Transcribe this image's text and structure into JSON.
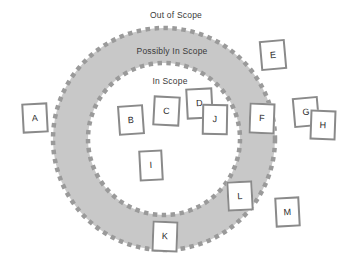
{
  "diagram": {
    "type": "scope-venn-ring",
    "canvas": {
      "width": 351,
      "height": 265,
      "background": "#ffffff"
    },
    "colors": {
      "band_fill": "#c8c8c8",
      "boundary_dash": "#9a9a9a",
      "box_border": "#8a8a8a",
      "box_fill": "#ffffff",
      "label_text": "#3a3a3a",
      "item_text": "#2b2b2b"
    },
    "rings": {
      "center": {
        "x": 164,
        "y": 139
      },
      "outer_radius": 111,
      "inner_radius": 76
    },
    "zones": [
      {
        "id": "out-of-scope",
        "label": "Out of Scope",
        "x": 176,
        "y": 10
      },
      {
        "id": "possibly-in-scope",
        "label": "Possibly In Scope",
        "x": 172,
        "y": 46
      },
      {
        "id": "in-scope",
        "label": "In Scope",
        "x": 170,
        "y": 76
      }
    ],
    "items": [
      {
        "id": "A",
        "label": "A",
        "zone": "out-of-scope",
        "x": 22,
        "y": 103,
        "w": 26,
        "h": 30,
        "rotate": -3
      },
      {
        "id": "B",
        "label": "B",
        "zone": "in-scope",
        "x": 118,
        "y": 105,
        "w": 26,
        "h": 30,
        "rotate": -4
      },
      {
        "id": "C",
        "label": "C",
        "zone": "in-scope",
        "x": 153,
        "y": 96,
        "w": 27,
        "h": 30,
        "rotate": 3
      },
      {
        "id": "D",
        "label": "D",
        "zone": "in-scope",
        "x": 186,
        "y": 88,
        "w": 27,
        "h": 31,
        "rotate": -3
      },
      {
        "id": "J",
        "label": "J",
        "zone": "in-scope",
        "x": 202,
        "y": 104,
        "w": 26,
        "h": 31,
        "rotate": 1
      },
      {
        "id": "E",
        "label": "E",
        "zone": "out-of-scope",
        "x": 260,
        "y": 40,
        "w": 26,
        "h": 30,
        "rotate": -5
      },
      {
        "id": "F",
        "label": "F",
        "zone": "possibly-in-scope",
        "x": 249,
        "y": 103,
        "w": 26,
        "h": 31,
        "rotate": 2
      },
      {
        "id": "G",
        "label": "G",
        "zone": "out-of-scope",
        "x": 293,
        "y": 97,
        "w": 26,
        "h": 30,
        "rotate": -5
      },
      {
        "id": "H",
        "label": "H",
        "zone": "out-of-scope",
        "x": 310,
        "y": 110,
        "w": 26,
        "h": 30,
        "rotate": 2
      },
      {
        "id": "I",
        "label": "I",
        "zone": "in-scope",
        "x": 139,
        "y": 150,
        "w": 24,
        "h": 31,
        "rotate": -3
      },
      {
        "id": "L",
        "label": "L",
        "zone": "possibly-in-scope",
        "x": 227,
        "y": 181,
        "w": 26,
        "h": 30,
        "rotate": -3
      },
      {
        "id": "K",
        "label": "K",
        "zone": "possibly-in-scope",
        "x": 152,
        "y": 221,
        "w": 26,
        "h": 31,
        "rotate": 2
      },
      {
        "id": "M",
        "label": "M",
        "zone": "out-of-scope",
        "x": 275,
        "y": 197,
        "w": 25,
        "h": 30,
        "rotate": -3
      }
    ]
  }
}
